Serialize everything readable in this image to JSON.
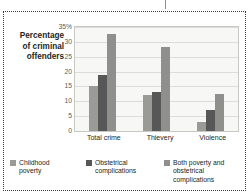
{
  "figure": {
    "frame_style": "dotted",
    "top_tick_icon": "vertical-tick-icon"
  },
  "chart_data": {
    "type": "bar",
    "title": "",
    "subtitle": "",
    "xlabel": "",
    "ylabel": "Percentage of criminal offenders",
    "ylabel_lines": [
      "Percentage",
      "of criminal",
      "offenders"
    ],
    "categories": [
      "Total crime",
      "Thievery",
      "Violence"
    ],
    "series": [
      {
        "name": "Childhood poverty",
        "name_lines": [
          "Childhood",
          "poverty"
        ],
        "color": "#9a9a96",
        "values": [
          15.3,
          12.0,
          3.2
        ]
      },
      {
        "name": "Obstetrical complications",
        "name_lines": [
          "Obstetrical",
          "complications"
        ],
        "color": "#575757",
        "values": [
          18.7,
          13.1,
          7.2
        ]
      },
      {
        "name": "Both poverty and obstetrical complications",
        "name_lines": [
          "Both poverty and",
          "obstetrical complications"
        ],
        "color": "#8f8f8b",
        "values": [
          32.7,
          28.2,
          12.6
        ]
      }
    ],
    "ylim": [
      0,
      35
    ],
    "yticks": [
      0,
      5,
      10,
      15,
      20,
      25,
      30,
      35
    ],
    "ytick_labels": [
      "0",
      "5",
      "10",
      "15",
      "20",
      "25",
      "30",
      "35%"
    ],
    "grid": true,
    "legend_position": "bottom",
    "plot_background": "#f7f7f5",
    "gridline_color": "#dcdcd8"
  }
}
